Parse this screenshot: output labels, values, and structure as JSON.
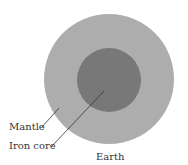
{
  "diagram": {
    "title": "Earth",
    "labels": {
      "mantle": "Mantle",
      "core": "Iron core",
      "caption": "Earth"
    },
    "colors": {
      "background": "#ffffff",
      "mantle": "#adadad",
      "core": "#787878",
      "leader_line": "#333333",
      "text": "#333333"
    }
  }
}
